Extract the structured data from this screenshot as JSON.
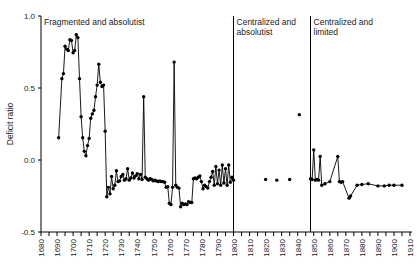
{
  "chart_data": {
    "type": "line",
    "title": "",
    "xlabel": "",
    "ylabel": "Deficit ratio",
    "ylim": [
      -0.5,
      1.0
    ],
    "xlim": [
      1680,
      1914
    ],
    "y_ticks": [
      -0.5,
      0.0,
      0.5,
      1.0
    ],
    "y_tick_labels": [
      "-0.5",
      "0.0",
      "0.5",
      "1.0"
    ],
    "x_ticks_major": [
      1680,
      1690,
      1700,
      1710,
      1720,
      1730,
      1740,
      1750,
      1760,
      1770,
      1780,
      1790,
      1800,
      1810,
      1820,
      1830,
      1840,
      1850,
      1860,
      1870,
      1880,
      1890,
      1900,
      1910
    ],
    "x_tick_labels": [
      "1680",
      "1690",
      "1700",
      "1710",
      "1720",
      "1730",
      "1740",
      "1750",
      "1760",
      "1770",
      "1780",
      "1790",
      "1800",
      "1810",
      "1820",
      "1830",
      "1840",
      "1850",
      "1860",
      "1870",
      "1880",
      "1890",
      "1900",
      "1910"
    ],
    "x_minor_step": 5,
    "grid": false,
    "legend": "none",
    "marker": "filled-circle",
    "line_color": "#000000",
    "marker_color": "#000000",
    "panel_dividers": [
      1800,
      1848
    ],
    "panels": [
      {
        "name": "fragmented-absolutist",
        "label": "Fragmented and absolutist",
        "x_start": 1680,
        "x_end": 1800
      },
      {
        "name": "centralized-absolutist",
        "label": "Centralized and absolutist",
        "x_start": 1800,
        "x_end": 1848
      },
      {
        "name": "centralized-limited",
        "label": "Centralized and limited",
        "x_start": 1848,
        "x_end": 1914
      }
    ],
    "series": [
      {
        "name": "fragmented-absolutist",
        "connected": true,
        "points": [
          [
            1691,
            0.155
          ],
          [
            1693,
            0.565
          ],
          [
            1694,
            0.6
          ],
          [
            1695,
            0.79
          ],
          [
            1696,
            0.77
          ],
          [
            1697,
            0.76
          ],
          [
            1698,
            0.835
          ],
          [
            1699,
            0.83
          ],
          [
            1700,
            0.745
          ],
          [
            1701,
            0.76
          ],
          [
            1702,
            0.87
          ],
          [
            1703,
            0.85
          ],
          [
            1704,
            0.565
          ],
          [
            1705,
            0.3
          ],
          [
            1706,
            0.155
          ],
          [
            1707,
            0.06
          ],
          [
            1708,
            0.03
          ],
          [
            1709,
            0.1
          ],
          [
            1710,
            0.15
          ],
          [
            1711,
            0.29
          ],
          [
            1712,
            0.32
          ],
          [
            1713,
            0.345
          ],
          [
            1714,
            0.44
          ],
          [
            1715,
            0.52
          ],
          [
            1716,
            0.665
          ],
          [
            1717,
            0.54
          ],
          [
            1718,
            0.51
          ],
          [
            1719,
            0.52
          ],
          [
            1720,
            0.2
          ],
          [
            1721,
            -0.255
          ],
          [
            1722,
            -0.19
          ],
          [
            1723,
            -0.235
          ],
          [
            1724,
            -0.115
          ],
          [
            1725,
            -0.2
          ],
          [
            1726,
            -0.175
          ],
          [
            1727,
            -0.075
          ],
          [
            1728,
            -0.15
          ],
          [
            1729,
            -0.145
          ],
          [
            1730,
            -0.115
          ],
          [
            1731,
            -0.1
          ],
          [
            1732,
            -0.14
          ],
          [
            1733,
            -0.13
          ],
          [
            1734,
            -0.06
          ],
          [
            1735,
            -0.14
          ],
          [
            1736,
            -0.125
          ],
          [
            1737,
            -0.09
          ],
          [
            1738,
            -0.125
          ],
          [
            1739,
            -0.11
          ],
          [
            1740,
            -0.095
          ],
          [
            1741,
            -0.13
          ],
          [
            1742,
            -0.1
          ],
          [
            1743,
            -0.135
          ],
          [
            1744,
            0.44
          ],
          [
            1745,
            -0.12
          ],
          [
            1746,
            -0.13
          ],
          [
            1747,
            -0.14
          ],
          [
            1748,
            -0.13
          ],
          [
            1749,
            -0.135
          ],
          [
            1750,
            -0.145
          ],
          [
            1751,
            -0.14
          ],
          [
            1752,
            -0.145
          ],
          [
            1753,
            -0.15
          ],
          [
            1754,
            -0.145
          ],
          [
            1755,
            -0.15
          ],
          [
            1756,
            -0.15
          ],
          [
            1757,
            -0.155
          ],
          [
            1758,
            -0.19
          ],
          [
            1759,
            -0.185
          ],
          [
            1760,
            -0.3
          ],
          [
            1761,
            -0.31
          ],
          [
            1762,
            -0.19
          ],
          [
            1763,
            0.68
          ],
          [
            1764,
            -0.175
          ],
          [
            1765,
            -0.19
          ],
          [
            1766,
            -0.195
          ],
          [
            1767,
            -0.325
          ],
          [
            1768,
            -0.3
          ],
          [
            1769,
            -0.31
          ],
          [
            1770,
            -0.305
          ],
          [
            1771,
            -0.31
          ],
          [
            1772,
            -0.29
          ],
          [
            1773,
            -0.295
          ],
          [
            1774,
            -0.295
          ],
          [
            1775,
            -0.13
          ],
          [
            1776,
            -0.125
          ],
          [
            1777,
            -0.13
          ],
          [
            1778,
            -0.12
          ],
          [
            1779,
            -0.11
          ],
          [
            1780,
            -0.15
          ],
          [
            1781,
            -0.2
          ],
          [
            1782,
            -0.175
          ],
          [
            1783,
            -0.185
          ],
          [
            1784,
            -0.195
          ],
          [
            1785,
            -0.15
          ],
          [
            1786,
            -0.12
          ],
          [
            1787,
            -0.08
          ],
          [
            1788,
            -0.175
          ],
          [
            1789,
            -0.045
          ],
          [
            1790,
            -0.165
          ],
          [
            1791,
            -0.07
          ],
          [
            1792,
            -0.175
          ],
          [
            1793,
            -0.035
          ],
          [
            1794,
            -0.16
          ],
          [
            1795,
            -0.06
          ],
          [
            1796,
            -0.175
          ],
          [
            1797,
            -0.035
          ],
          [
            1798,
            -0.155
          ],
          [
            1799,
            -0.12
          ],
          [
            1800,
            -0.14
          ]
        ]
      },
      {
        "name": "centralized-absolutist",
        "connected": false,
        "points": [
          [
            1820,
            -0.135
          ],
          [
            1827,
            -0.14
          ],
          [
            1835,
            -0.135
          ],
          [
            1841,
            0.315
          ]
        ]
      },
      {
        "name": "centralized-limited",
        "connected": true,
        "points": [
          [
            1848,
            -0.13
          ],
          [
            1849,
            -0.135
          ],
          [
            1850,
            0.07
          ],
          [
            1851,
            -0.14
          ],
          [
            1852,
            -0.135
          ],
          [
            1853,
            -0.14
          ],
          [
            1854,
            0.025
          ],
          [
            1855,
            -0.175
          ],
          [
            1857,
            -0.165
          ],
          [
            1860,
            -0.15
          ],
          [
            1865,
            0.025
          ],
          [
            1866,
            -0.15
          ],
          [
            1867,
            -0.155
          ],
          [
            1868,
            -0.15
          ],
          [
            1872,
            -0.265
          ],
          [
            1873,
            -0.25
          ],
          [
            1877,
            -0.175
          ],
          [
            1880,
            -0.17
          ],
          [
            1884,
            -0.165
          ],
          [
            1890,
            -0.18
          ],
          [
            1894,
            -0.18
          ],
          [
            1897,
            -0.175
          ],
          [
            1900,
            -0.175
          ],
          [
            1905,
            -0.175
          ]
        ]
      }
    ]
  },
  "geometry": {
    "plot_left": 41,
    "plot_right": 412,
    "plot_top": 16,
    "plot_bottom": 232
  }
}
